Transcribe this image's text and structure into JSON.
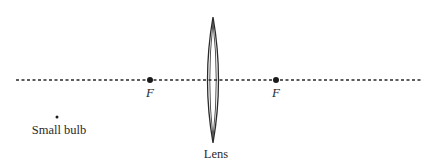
{
  "diagram": {
    "type": "optics-ray-diagram",
    "colors": {
      "ink": "#2a2a2a",
      "background": "#ffffff"
    },
    "optical_axis": {
      "style": "dotted",
      "x_start": 16,
      "x_end": 423,
      "y": 80
    },
    "lens": {
      "label": "Lens",
      "type": "converging",
      "center_x": 213,
      "top_y": 17,
      "bottom_y": 143,
      "half_width": 5
    },
    "focal_points": [
      {
        "label": "F",
        "x": 150,
        "y": 80
      },
      {
        "label": "F",
        "x": 276,
        "y": 80
      }
    ],
    "object": {
      "label": "Small bulb",
      "x": 57,
      "y": 117
    }
  }
}
